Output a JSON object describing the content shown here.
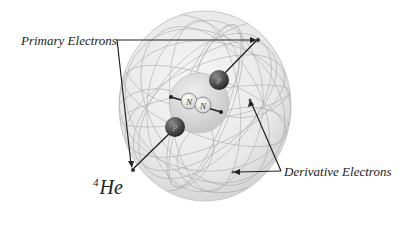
{
  "labels": {
    "primary_electrons": "Primary Electrons",
    "derivative_electrons": "Derivative Electrons",
    "isotope_mass": "4",
    "isotope_symbol": "He"
  },
  "particles": {
    "proton_label": "P",
    "neutron_label": "N"
  },
  "colors": {
    "outer_sphere": "#e6e6e6",
    "inner_sphere": "#d8d8d8",
    "proton": "#3a3a3a",
    "neutron": "#f4f4f4",
    "lines": "#222222"
  }
}
